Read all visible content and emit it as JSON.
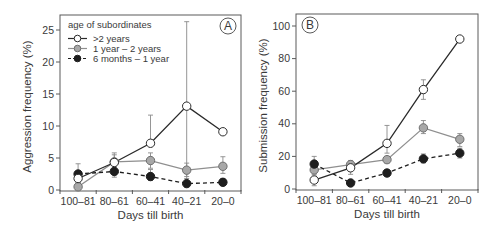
{
  "colors": {
    "frame": "#5a5a5a",
    "text": "#3a3a3a",
    "series_white_fill": "#ffffff",
    "series_white_line": "#2a2a2a",
    "series_gray_fill": "#a8a8a8",
    "series_gray_line": "#8f8f8f",
    "series_black_fill": "#1e1e1e",
    "series_black_line": "#1e1e1e",
    "errorbar": "#8a8a8a"
  },
  "legend": {
    "title": "age of subordinates",
    "entries": [
      {
        "label": ">2 years",
        "style": "open-circle-solid"
      },
      {
        "label": "1 year – 2 years",
        "style": "gray-circle-solid"
      },
      {
        "label": "6 months – 1 year",
        "style": "filled-circle-dashed"
      }
    ]
  },
  "chart_data": [
    {
      "panel": "A",
      "type": "line",
      "title": "",
      "xlabel": "Days till birth",
      "ylabel": "Aggression frequency (%)",
      "categories": [
        "100–81",
        "80–61",
        "60–41",
        "40–21",
        "20–0"
      ],
      "ylim": [
        0,
        27
      ],
      "yticks": [
        0,
        5,
        10,
        15,
        20,
        25
      ],
      "grid": false,
      "legend_position": "upper left",
      "series": [
        {
          "name": ">2 years",
          "values": [
            1.8,
            4.3,
            7.3,
            13.1,
            9.1
          ],
          "err_upper": [
            2.8,
            5.5,
            11.7,
            26.3,
            9.1
          ],
          "err_lower": [
            1.2,
            3.8,
            7.3,
            0.5,
            9.1
          ]
        },
        {
          "name": "1 year – 2 years",
          "values": [
            0.5,
            4.4,
            4.6,
            3.1,
            3.7
          ],
          "err_upper": [
            1.2,
            5.8,
            5.8,
            4.2,
            5.2
          ],
          "err_lower": [
            0.0,
            3.2,
            3.4,
            2.1,
            2.6
          ]
        },
        {
          "name": "6 months – 1 year",
          "values": [
            2.5,
            2.9,
            2.1,
            1.0,
            1.2
          ],
          "err_upper": [
            4.1,
            3.6,
            3.2,
            1.8,
            1.8
          ],
          "err_lower": [
            1.5,
            2.0,
            1.5,
            0.5,
            0.7
          ]
        }
      ]
    },
    {
      "panel": "B",
      "type": "line",
      "title": "",
      "xlabel": "Days till birth",
      "ylabel": "Submission frequency (%)",
      "categories": [
        "100–81",
        "80–61",
        "60–41",
        "40–21",
        "20–0"
      ],
      "ylim": [
        0,
        107
      ],
      "yticks": [
        0,
        20,
        40,
        60,
        80,
        100
      ],
      "grid": false,
      "series": [
        {
          "name": ">2 years",
          "values": [
            5.5,
            13,
            28,
            61,
            92
          ],
          "err_upper": [
            8,
            16,
            39,
            67,
            92
          ],
          "err_lower": [
            2,
            9,
            22,
            55,
            92
          ]
        },
        {
          "name": "1 year – 2 years",
          "values": [
            11.7,
            15,
            18,
            37.5,
            30.5
          ],
          "err_upper": [
            14,
            17.5,
            20,
            42,
            34
          ],
          "err_lower": [
            9,
            12.5,
            16,
            34,
            26
          ]
        },
        {
          "name": "6 months – 1 year",
          "values": [
            15.3,
            3.7,
            9.8,
            18.5,
            22
          ],
          "err_upper": [
            20,
            4.5,
            11.5,
            21.5,
            25
          ],
          "err_lower": [
            11,
            3,
            8.5,
            16,
            19
          ]
        }
      ]
    }
  ]
}
